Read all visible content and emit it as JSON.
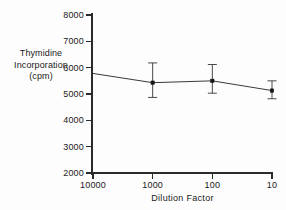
{
  "chart_data": {
    "type": "line",
    "title": "",
    "xlabel": "Dilution Factor",
    "ylabel": "Thymidine Incorporation (cpm)",
    "ylabel_lines": [
      "Thymidine",
      "Incorporation",
      "(cpm)"
    ],
    "xscale": "log-reversed",
    "x_tick_labels": [
      "10000",
      "1000",
      "100",
      "10"
    ],
    "x_tick_values": [
      10000,
      1000,
      100,
      10
    ],
    "y_tick_labels": [
      "8000",
      "7000",
      "6000",
      "5000",
      "4000",
      "3000",
      "2000"
    ],
    "y_tick_values": [
      8000,
      7000,
      6000,
      5000,
      4000,
      3000,
      2000
    ],
    "ylim": [
      2000,
      8000
    ],
    "grid": false,
    "legend": false,
    "series": [
      {
        "name": "Thymidine Incorporation",
        "line_start": {
          "x": 10000,
          "y": 5780,
          "marker": false
        },
        "points": [
          {
            "x": 1000,
            "y": 5430,
            "err_low": 4870,
            "err_high": 6180,
            "marker": true
          },
          {
            "x": 100,
            "y": 5500,
            "err_low": 5030,
            "err_high": 6120,
            "marker": true
          },
          {
            "x": 10,
            "y": 5130,
            "err_low": 4820,
            "err_high": 5500,
            "marker": true
          }
        ]
      }
    ]
  },
  "axis": {
    "x_title": "Dilution Factor",
    "y_title_line1": "Thymidine",
    "y_title_line2": "Incorporation",
    "y_title_line3": "(cpm)"
  },
  "colors": {
    "axis": "#2b2b2b",
    "line": "#3a3a3a",
    "marker": "#141414",
    "errorbar": "#4a4a4a",
    "background": "#fdfdfd"
  }
}
